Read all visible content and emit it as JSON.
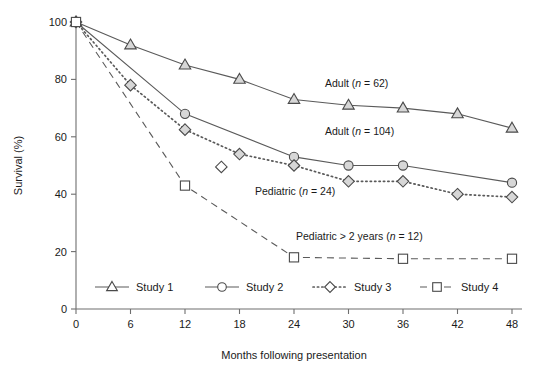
{
  "chart_data": {
    "type": "line",
    "title": "",
    "xlabel": "Months following presentation",
    "ylabel": "Survival (%)",
    "xlim": [
      0,
      48
    ],
    "ylim": [
      0,
      100
    ],
    "xticks": [
      0,
      6,
      12,
      18,
      24,
      30,
      36,
      42,
      48
    ],
    "yticks": [
      0,
      20,
      40,
      60,
      80,
      100
    ],
    "grid": false,
    "legend_position": "bottom-inside",
    "series": [
      {
        "name": "Study 1",
        "marker": "triangle",
        "linestyle": "solid",
        "annotation": "Adult (n = 62)",
        "x": [
          0,
          6,
          12,
          18,
          24,
          30,
          36,
          42,
          48
        ],
        "values": [
          100,
          92,
          85,
          80,
          73,
          71,
          70,
          68,
          63
        ]
      },
      {
        "name": "Study 2",
        "marker": "circle",
        "linestyle": "solid",
        "annotation": "Adult (n = 104)",
        "x": [
          0,
          12,
          24,
          30,
          36,
          48
        ],
        "values": [
          100,
          68,
          53,
          50,
          50,
          44
        ]
      },
      {
        "name": "Study 3",
        "marker": "diamond",
        "linestyle": "dotted",
        "annotation": "Pediatric (n = 24)",
        "x": [
          0,
          6,
          12,
          18,
          24,
          30,
          36,
          42,
          48
        ],
        "values": [
          100,
          78,
          62.5,
          54,
          50,
          44.5,
          44.5,
          40,
          39
        ]
      },
      {
        "name": "Study 3 extra point",
        "marker": "diamond",
        "linestyle": "none",
        "annotation": "",
        "x": [
          16
        ],
        "values": [
          49.5
        ]
      },
      {
        "name": "Study 4",
        "marker": "square",
        "linestyle": "dashed",
        "annotation": "Pediatric > 2 years (n = 12)",
        "x": [
          0,
          12,
          24,
          36,
          48
        ],
        "values": [
          100,
          43,
          18,
          17.5,
          17.5
        ]
      }
    ],
    "annotations": [
      {
        "text_plain": "Adult (n = 62)",
        "pre": "Adult (",
        "ital": "n",
        "post": " = 62)"
      },
      {
        "text_plain": "Adult (n = 104)",
        "pre": "Adult (",
        "ital": "n",
        "post": " = 104)"
      },
      {
        "text_plain": "Pediatric (n = 24)",
        "pre": "Pediatric (",
        "ital": "n",
        "post": " = 24)"
      },
      {
        "text_plain": "Pediatric > 2 years (n = 12)",
        "pre": "Pediatric > 2 years (",
        "ital": "n",
        "post": " = 12)"
      }
    ],
    "legend": [
      {
        "label": "Study 1",
        "marker": "triangle",
        "linestyle": "solid"
      },
      {
        "label": "Study 2",
        "marker": "circle",
        "linestyle": "solid"
      },
      {
        "label": "Study 3",
        "marker": "diamond",
        "linestyle": "dotted"
      },
      {
        "label": "Study 4",
        "marker": "square",
        "linestyle": "dashed"
      }
    ],
    "colors": {
      "axis": "#6e6e6e",
      "line": "#5a5a5a",
      "marker_fill": "#d7d7d7",
      "marker_stroke": "#4a4a4a",
      "text": "#1a1a1a",
      "background": "#ffffff"
    }
  },
  "ticklabels": {
    "x": [
      "0",
      "6",
      "12",
      "18",
      "24",
      "30",
      "36",
      "42",
      "48"
    ],
    "y": [
      "0",
      "20",
      "40",
      "60",
      "80",
      "100"
    ]
  }
}
